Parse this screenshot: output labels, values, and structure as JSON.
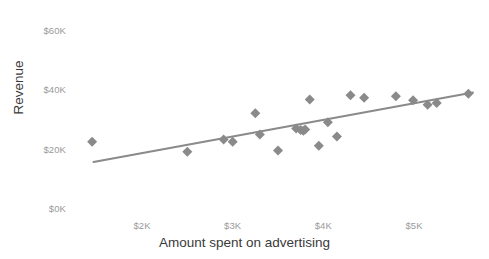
{
  "chart_data": {
    "type": "scatter",
    "title": "",
    "xlabel": "Amount spent on advertising",
    "ylabel": "Revenue",
    "xlim": [
      1450,
      5550
    ],
    "ylim": [
      0,
      62000
    ],
    "grid": false,
    "legend": null,
    "marker": {
      "shape": "diamond",
      "color": "#8a8a8a",
      "size": 7
    },
    "trendline": {
      "type": "linear",
      "color": "#8a8a8a",
      "width": 2,
      "x": [
        1465,
        5650
      ],
      "y": [
        15500,
        38900
      ]
    },
    "xticks": [
      2000,
      3000,
      4000,
      5000
    ],
    "xticklabels": [
      "$2K",
      "$3K",
      "$4K",
      "$5K"
    ],
    "yticks": [
      0,
      20000,
      40000,
      60000
    ],
    "yticklabels": [
      "$0K",
      "$20K",
      "$40K",
      "$60K"
    ],
    "points": [
      {
        "x": 1450,
        "y": 22300
      },
      {
        "x": 2500,
        "y": 19000
      },
      {
        "x": 2900,
        "y": 23100
      },
      {
        "x": 3000,
        "y": 22300
      },
      {
        "x": 3250,
        "y": 31900
      },
      {
        "x": 3300,
        "y": 24800
      },
      {
        "x": 3500,
        "y": 19400
      },
      {
        "x": 3700,
        "y": 26800
      },
      {
        "x": 3750,
        "y": 26300
      },
      {
        "x": 3780,
        "y": 26000
      },
      {
        "x": 3800,
        "y": 26500
      },
      {
        "x": 3850,
        "y": 36600
      },
      {
        "x": 3950,
        "y": 21000
      },
      {
        "x": 4050,
        "y": 28900
      },
      {
        "x": 4150,
        "y": 24100
      },
      {
        "x": 4300,
        "y": 38000
      },
      {
        "x": 4450,
        "y": 37200
      },
      {
        "x": 4800,
        "y": 37700
      },
      {
        "x": 4990,
        "y": 36300
      },
      {
        "x": 5150,
        "y": 34800
      },
      {
        "x": 5250,
        "y": 35400
      },
      {
        "x": 5600,
        "y": 38500
      }
    ],
    "colors": {
      "marker": "#8a8a8a",
      "line": "#8a8a8a",
      "tick_text": "#9a9a9a",
      "axis_title_text": "#3a3a3a",
      "background": "#ffffff"
    }
  }
}
